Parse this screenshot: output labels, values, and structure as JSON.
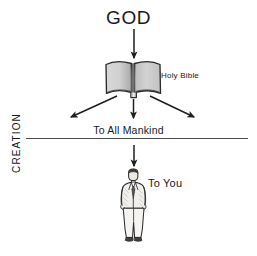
{
  "diagram": {
    "title": "GOD",
    "axis_label": "CREATION",
    "nodes": [
      {
        "id": "god",
        "label": "GOD"
      },
      {
        "id": "bible",
        "label": "Holy Bible"
      },
      {
        "id": "mankind",
        "label": "To All Mankind"
      },
      {
        "id": "you",
        "label": "To You"
      }
    ],
    "labels": {
      "god": "GOD",
      "holy_bible": "Holy Bible",
      "to_all_mankind": "To All Mankind",
      "to_you": "To You",
      "creation": "CREATION"
    },
    "colors": {
      "ink": "#1a1a1a",
      "stroke": "#2b2b2b",
      "page_fill_light": "#e2e2e2",
      "page_fill_dark": "#b4b4b4",
      "background": "#ffffff",
      "divider": "#4a4a4a"
    },
    "flow": [
      {
        "from": "god",
        "to": "bible",
        "direction": "down"
      },
      {
        "from": "bible",
        "to": "mankind",
        "direction": "down-left"
      },
      {
        "from": "bible",
        "to": "mankind",
        "direction": "down"
      },
      {
        "from": "bible",
        "to": "mankind",
        "direction": "down-right"
      },
      {
        "from": "mankind",
        "to": "you",
        "direction": "down"
      }
    ]
  }
}
